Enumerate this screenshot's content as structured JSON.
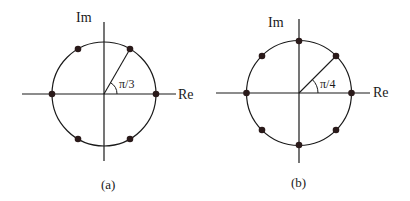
{
  "figure": {
    "panels": [
      {
        "id": "a",
        "caption": "(a)",
        "axis_labels": {
          "imag": "Im",
          "real": "Re"
        },
        "angle_label": "π/3",
        "n_points": 6,
        "angle_step": "π/3",
        "points_deg": [
          0,
          60,
          120,
          180,
          240,
          300
        ]
      },
      {
        "id": "b",
        "caption": "(b)",
        "axis_labels": {
          "imag": "Im",
          "real": "Re"
        },
        "angle_label": "π/4",
        "n_points": 8,
        "angle_step": "π/4",
        "points_deg": [
          0,
          45,
          90,
          135,
          180,
          225,
          270,
          315
        ]
      }
    ],
    "colors": {
      "ink": "#1a1a1a",
      "dot": "#2a1a1a",
      "background": "#ffffff"
    }
  }
}
